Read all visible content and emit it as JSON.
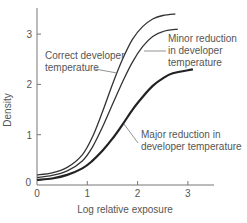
{
  "chart_data": {
    "type": "line",
    "title": "",
    "xlabel": "Log relative exposure",
    "ylabel": "Density",
    "xlim": [
      0,
      3.5
    ],
    "ylim": [
      0,
      3.5
    ],
    "xticks": [
      0,
      1,
      2,
      3
    ],
    "yticks": [
      0,
      1,
      2,
      3
    ],
    "grid": false,
    "legend": "none (inline annotations)",
    "series": [
      {
        "name": "Correct developer temperature",
        "color": "#333333",
        "stroke_width": 1.3,
        "x": [
          0,
          0.3,
          0.6,
          0.9,
          1.1,
          1.3,
          1.5,
          1.7,
          1.9,
          2.1,
          2.3,
          2.5,
          2.75
        ],
        "y": [
          0.2,
          0.24,
          0.35,
          0.6,
          0.95,
          1.45,
          2.0,
          2.5,
          2.9,
          3.15,
          3.3,
          3.37,
          3.4
        ]
      },
      {
        "name": "Minor reduction in developer temperature",
        "color": "#333333",
        "stroke_width": 1.3,
        "x": [
          0,
          0.3,
          0.6,
          0.9,
          1.1,
          1.3,
          1.5,
          1.7,
          1.9,
          2.1,
          2.3,
          2.5,
          2.8
        ],
        "y": [
          0.15,
          0.19,
          0.28,
          0.48,
          0.75,
          1.15,
          1.6,
          2.05,
          2.45,
          2.75,
          2.95,
          3.05,
          3.1
        ]
      },
      {
        "name": "Major reduction in developer temperature",
        "color": "#222222",
        "stroke_width": 2.2,
        "x": [
          0,
          0.3,
          0.6,
          0.9,
          1.1,
          1.3,
          1.5,
          1.7,
          1.9,
          2.1,
          2.3,
          2.5,
          2.7,
          3.1
        ],
        "y": [
          0.1,
          0.13,
          0.2,
          0.33,
          0.48,
          0.68,
          0.92,
          1.2,
          1.5,
          1.75,
          1.97,
          2.12,
          2.22,
          2.3
        ]
      }
    ],
    "annotations": [
      {
        "text_lines": [
          "Correct developer",
          "temperature"
        ],
        "series": 0
      },
      {
        "text_lines": [
          "Minor reduction",
          "in developer",
          "temperature"
        ],
        "series": 1
      },
      {
        "text_lines": [
          "Major reduction in",
          "developer temperature"
        ],
        "series": 2
      }
    ]
  }
}
